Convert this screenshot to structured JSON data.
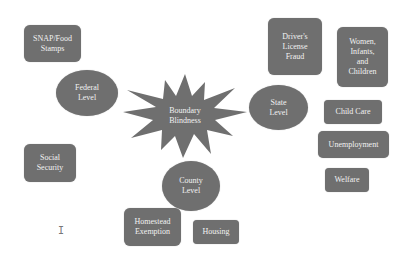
{
  "diagram": {
    "center": {
      "label": "Boundary Blindness",
      "line1": "Boundary",
      "line2": "Blindness",
      "shape": "star"
    },
    "levels": {
      "federal": {
        "line1": "Federal",
        "line2": "Level"
      },
      "state": {
        "line1": "State",
        "line2": "Level"
      },
      "county": {
        "line1": "County",
        "line2": "Level"
      }
    },
    "programs": {
      "snap": {
        "line1": "SNAP/Food",
        "line2": "Stamps"
      },
      "social_security": {
        "line1": "Social",
        "line2": "Security"
      },
      "drivers_license": {
        "line1": "Driver's",
        "line2": "License",
        "line3": "Fraud"
      },
      "wic": {
        "line1": "Women,",
        "line2": "Infants,",
        "line3": "and",
        "line4": "Children"
      },
      "child_care": {
        "line1": "Child Care"
      },
      "unemployment": {
        "line1": "Unemployment"
      },
      "welfare": {
        "line1": "Welfare"
      },
      "homestead": {
        "line1": "Homestead",
        "line2": "Exemption"
      },
      "housing": {
        "line1": "Housing"
      }
    },
    "colors": {
      "node_fill": "#6f6f6f",
      "node_text": "#f2f2f2",
      "background": "#ffffff"
    }
  }
}
